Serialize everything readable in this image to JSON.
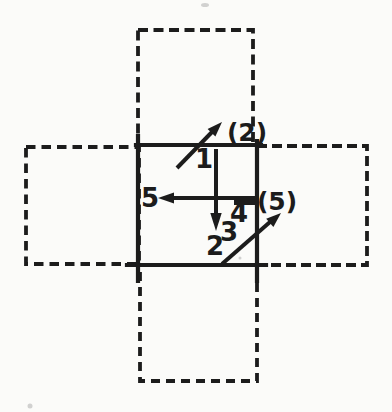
{
  "meta": {
    "background_color": "#fbfbf9",
    "ink_color": "#1c1c1c",
    "speck_color": "#b0b0b0"
  },
  "diagram": {
    "kind": "periodic-boundary-cells-figure",
    "labels": {
      "particle1": "1",
      "particle2": "2",
      "particle3": "3",
      "particle4": "4",
      "particle5": "5",
      "image2": "(2)",
      "image5": "(5)"
    }
  }
}
